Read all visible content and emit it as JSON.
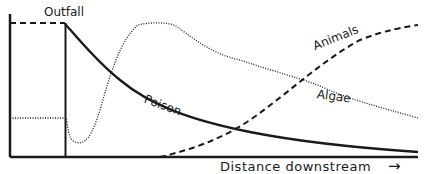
{
  "labels": {
    "outfall": "Outfall",
    "poison": "Poison",
    "algae": "Algae",
    "animals": "Animals",
    "x_axis": "Distance downstream",
    "arrow": "→"
  },
  "series": [
    {
      "name": "Poison",
      "style": "solid",
      "description": "Peaks at outfall, decays exponentially downstream"
    },
    {
      "name": "Algae",
      "style": "dotted",
      "description": "Moderate baseline, dips just after outfall, rises to peak, then declines gradually"
    },
    {
      "name": "Animals",
      "style": "dashed",
      "description": "Normal level upstream, drop to zero at outfall, recover gradually downstream"
    }
  ],
  "colors": {
    "line": "#1a1a1a",
    "background": "#ffffff"
  }
}
